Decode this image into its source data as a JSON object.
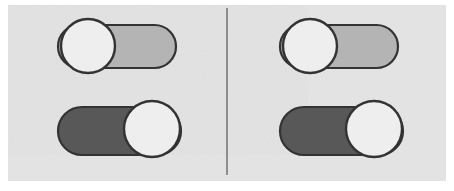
{
  "canvas": {
    "width": 454,
    "height": 191,
    "background_color": "#ffffff",
    "panel_color": "#e3e3e3",
    "panel": {
      "x": 8,
      "y": 5,
      "width": 438,
      "height": 176
    },
    "style": "scanned hand-drawn grayscale illustration"
  },
  "divider": {
    "name": "vertical separator line",
    "color": "#8e8e8e",
    "x": 226,
    "y": 8,
    "width": 2,
    "height": 167
  },
  "colors": {
    "outline": "#333333",
    "track_off_fill": "#b4b4b4",
    "track_on_fill": "#585858",
    "knob_fill": "#eeeeee",
    "panel": "#e3e3e3",
    "divider": "#8e8e8e"
  },
  "groups": [
    {
      "id": "left-group",
      "label": "Left toggle pair",
      "x": 8,
      "toggles": [
        {
          "id": "left-top",
          "label": "Toggle switch, knob left",
          "state": "off",
          "state_label": "Off",
          "knob_side": "left",
          "track_fill": "#b4b4b4",
          "knob_fill": "#eeeeee",
          "x": 50,
          "y": 17,
          "track_x": 8,
          "track_y": 8,
          "track_width": 118,
          "track_height": 43,
          "knob_cx": 38,
          "knob_cy": 29,
          "knob_r": 27
        },
        {
          "id": "left-bottom",
          "label": "Toggle switch, knob right",
          "state": "on",
          "state_label": "On",
          "knob_side": "right",
          "track_fill": "#585858",
          "knob_fill": "#eeeeee",
          "x": 50,
          "y": 99,
          "track_x": 8,
          "track_y": 8,
          "track_width": 123,
          "track_height": 48,
          "knob_cx": 102,
          "knob_cy": 30,
          "knob_r": 28
        }
      ]
    },
    {
      "id": "right-group",
      "label": "Right toggle pair",
      "x": 230,
      "toggles": [
        {
          "id": "right-top",
          "label": "Toggle switch, knob left",
          "state": "off",
          "state_label": "Off",
          "knob_side": "left",
          "track_fill": "#b4b4b4",
          "knob_fill": "#eeeeee",
          "x": 272,
          "y": 17,
          "track_x": 8,
          "track_y": 8,
          "track_width": 118,
          "track_height": 43,
          "knob_cx": 38,
          "knob_cy": 29,
          "knob_r": 27
        },
        {
          "id": "right-bottom",
          "label": "Toggle switch, knob right",
          "state": "on",
          "state_label": "On",
          "knob_side": "right",
          "track_fill": "#585858",
          "knob_fill": "#eeeeee",
          "x": 272,
          "y": 99,
          "track_x": 8,
          "track_y": 8,
          "track_width": 123,
          "track_height": 48,
          "knob_cx": 102,
          "knob_cy": 30,
          "knob_r": 28
        }
      ]
    }
  ]
}
